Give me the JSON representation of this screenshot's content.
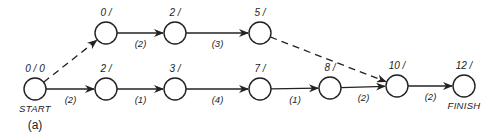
{
  "figure_label": "(a)",
  "nodes": [
    {
      "id": "start",
      "label": "0 / 0",
      "caption": "START",
      "x": 35,
      "y": 89
    },
    {
      "id": "b1",
      "label": "2 /",
      "x": 106,
      "y": 89
    },
    {
      "id": "b2",
      "label": "3 /",
      "x": 175,
      "y": 89
    },
    {
      "id": "b3",
      "label": "7 /",
      "x": 260,
      "y": 89
    },
    {
      "id": "b4",
      "label": "8 /",
      "x": 330,
      "y": 88
    },
    {
      "id": "b5",
      "label": "10 /",
      "x": 397,
      "y": 86
    },
    {
      "id": "finish",
      "label": "12 /",
      "caption": "FINISH",
      "x": 464,
      "y": 86
    },
    {
      "id": "t1",
      "label": "0 /",
      "x": 106,
      "y": 33
    },
    {
      "id": "t2",
      "label": "2 /",
      "x": 175,
      "y": 33
    },
    {
      "id": "t3",
      "label": "5 /",
      "x": 260,
      "y": 33
    }
  ],
  "edges": [
    {
      "from": "start",
      "to": "t1",
      "duration": "",
      "dashed": true
    },
    {
      "from": "t1",
      "to": "t2",
      "duration": "(2)",
      "dashed": false
    },
    {
      "from": "t2",
      "to": "t3",
      "duration": "(3)",
      "dashed": false
    },
    {
      "from": "t3",
      "to": "b5",
      "duration": "",
      "dashed": true
    },
    {
      "from": "start",
      "to": "b1",
      "duration": "(2)",
      "dashed": false
    },
    {
      "from": "b1",
      "to": "b2",
      "duration": "(1)",
      "dashed": false
    },
    {
      "from": "b2",
      "to": "b3",
      "duration": "(4)",
      "dashed": false
    },
    {
      "from": "b3",
      "to": "b4",
      "duration": "(1)",
      "dashed": false
    },
    {
      "from": "b4",
      "to": "b5",
      "duration": "(2)",
      "dashed": false
    },
    {
      "from": "b5",
      "to": "finish",
      "duration": "(2)",
      "dashed": false
    }
  ]
}
